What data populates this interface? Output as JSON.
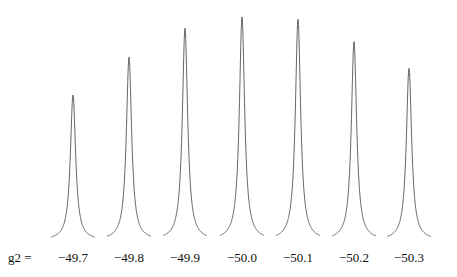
{
  "chart_data": {
    "type": "line",
    "title": "",
    "xlabel": "g2 =",
    "ylabel": "",
    "grid": false,
    "legend": null,
    "categories": [
      "−49.7",
      "−49.8",
      "−49.9",
      "−50.0",
      "−50.1",
      "−50.2",
      "−50.3"
    ],
    "series": [
      {
        "name": "peak height (relative)",
        "values": [
          0.65,
          0.82,
          0.95,
          1.0,
          0.99,
          0.89,
          0.77
        ]
      }
    ],
    "label_prefix": "g2 ="
  },
  "layout": {
    "baseline_y": 240,
    "max_height_px": 223,
    "centers_x": [
      73,
      129,
      185,
      242,
      298,
      354,
      409
    ],
    "half_width_px": 3.2,
    "tail_px": 22,
    "label_y": 262,
    "prefix_x": 8,
    "stroke": "#555555"
  }
}
